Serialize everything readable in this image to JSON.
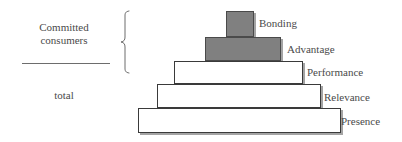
{
  "diagram": {
    "type": "pyramid",
    "title": "",
    "annotations": [
      {
        "id": "committed-consumers",
        "text": "Committed\nconsumers",
        "role": "bracket-group-label",
        "covers": [
          "Bonding",
          "Advantage"
        ]
      },
      {
        "id": "total",
        "text": "total",
        "role": "group-label",
        "covers": [
          "Performance",
          "Relevance",
          "Presence"
        ]
      }
    ],
    "brace": {
      "name": "curly-brace",
      "orientation": "left-facing",
      "spans": [
        "Bonding",
        "Advantage"
      ]
    },
    "divider": {
      "name": "horizontal-rule",
      "color": "#6d6d6d"
    },
    "colors": {
      "filled": "#808080",
      "empty": "#ffffff",
      "stroke": "#3a3a3a",
      "shadow": "#5a5a5a",
      "text": "#4a4a4a"
    },
    "levels": [
      {
        "label": "Bonding",
        "order": 1,
        "position": "top",
        "fill": "#808080",
        "filled": true,
        "x": 226,
        "y": 11,
        "width": 28,
        "height": 26,
        "label_x": 259,
        "label_y": 17
      },
      {
        "label": "Advantage",
        "order": 2,
        "fill": "#808080",
        "filled": true,
        "x": 205,
        "y": 37,
        "width": 76,
        "height": 24,
        "label_x": 287,
        "label_y": 43
      },
      {
        "label": "Performance",
        "order": 3,
        "fill": "#ffffff",
        "filled": false,
        "x": 174,
        "y": 61,
        "width": 129,
        "height": 23,
        "label_x": 307,
        "label_y": 66
      },
      {
        "label": "Relevance",
        "order": 4,
        "fill": "#ffffff",
        "filled": false,
        "x": 157,
        "y": 84,
        "width": 164,
        "height": 24,
        "label_x": 324,
        "label_y": 91
      },
      {
        "label": "Presence",
        "order": 5,
        "position": "base",
        "fill": "#ffffff",
        "filled": false,
        "x": 138,
        "y": 108,
        "width": 203,
        "height": 25,
        "label_x": 341,
        "label_y": 115
      }
    ]
  }
}
